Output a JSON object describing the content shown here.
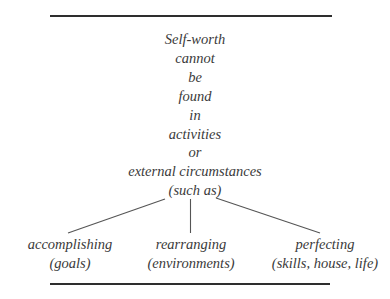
{
  "diagram": {
    "type": "tree",
    "root": {
      "lines": [
        "Self-worth",
        "cannot",
        "be",
        "found",
        "in",
        "activities",
        "or",
        "external circumstances",
        "(such as)"
      ]
    },
    "branches": [
      {
        "label": "accomplishing",
        "detail": "(goals)"
      },
      {
        "label": "rearranging",
        "detail": "(environments)"
      },
      {
        "label": "perfecting",
        "detail": "(skills, house, life)"
      }
    ],
    "colors": {
      "rule": "#2e2e2e",
      "connector": "#555555",
      "text": "#3a3a3a",
      "background": "#ffffff"
    }
  }
}
